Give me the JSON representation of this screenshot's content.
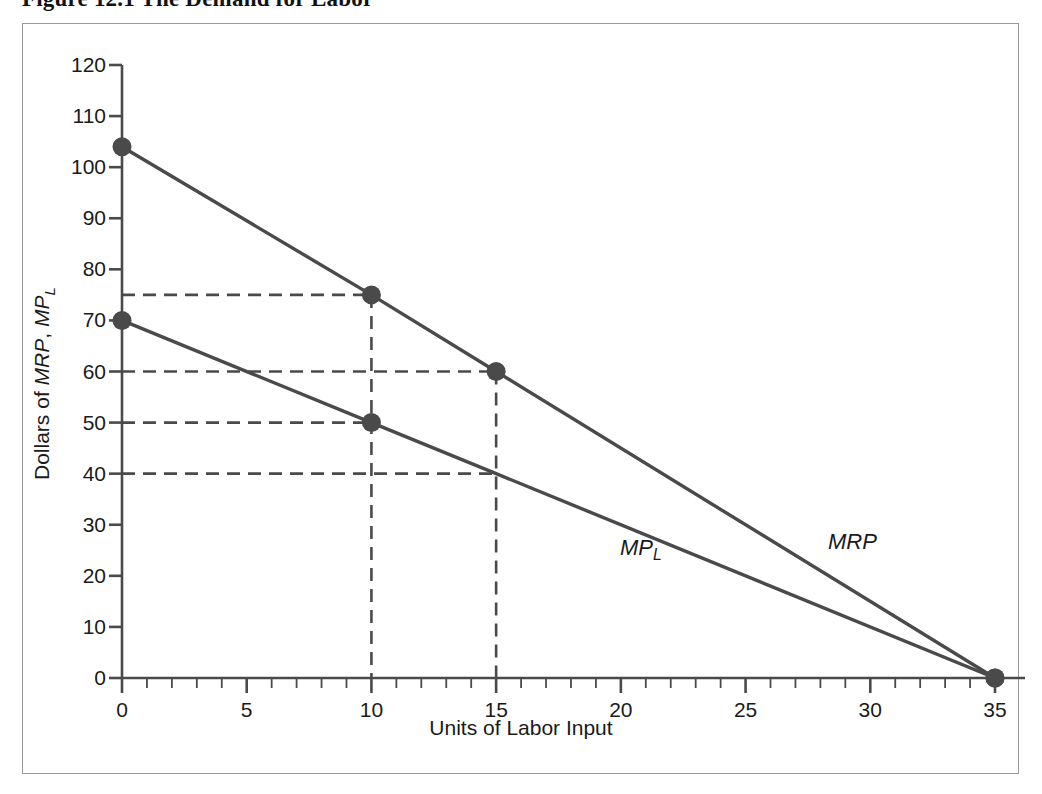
{
  "figure": {
    "caption": "Figure 12.1  The Demand for Labor",
    "border_color": "#9a9a9a",
    "background": "#ffffff"
  },
  "axes": {
    "x_title": "Units of Labor Input",
    "y_title_prefix": "Dollars of ",
    "y_title_series_1": "MRP",
    "y_title_separator": ", ",
    "y_title_series_2": "MP",
    "y_title_series_2_sub": "L",
    "x_ticks_major": [
      0,
      5,
      10,
      15,
      20,
      25,
      30,
      35
    ],
    "x_tick_labels": [
      "0",
      "5",
      "10",
      "15",
      "20",
      "25",
      "30",
      "35"
    ],
    "y_ticks_major": [
      0,
      10,
      20,
      30,
      40,
      50,
      60,
      70,
      80,
      90,
      100,
      110,
      120
    ],
    "y_tick_labels": [
      "0",
      "10",
      "20",
      "30",
      "40",
      "50",
      "60",
      "70",
      "80",
      "90",
      "100",
      "110",
      "120"
    ],
    "x_minor_interval": 1,
    "axis_color": "#4a4a4a"
  },
  "chart_data": {
    "type": "line",
    "title": "Figure 12.1  The Demand for Labor",
    "xlabel": "Units of Labor Input",
    "ylabel": "Dollars of MRP, MP_L",
    "xlim": [
      0,
      35
    ],
    "ylim": [
      0,
      120
    ],
    "grid": false,
    "legend": "inline-curve-labels",
    "series": [
      {
        "name": "MRP",
        "label": "MRP",
        "color": "#4a4a4a",
        "x": [
          0,
          10,
          15,
          35
        ],
        "y": [
          104,
          75,
          60,
          0
        ],
        "markers_at": [
          {
            "x": 0,
            "y": 104
          },
          {
            "x": 10,
            "y": 75
          },
          {
            "x": 15,
            "y": 60
          },
          {
            "x": 35,
            "y": 0
          }
        ]
      },
      {
        "name": "MP_L",
        "label": "MP",
        "label_sub": "L",
        "color": "#4a4a4a",
        "x": [
          0,
          10,
          15,
          35
        ],
        "y": [
          70,
          50,
          40,
          0
        ],
        "markers_at": [
          {
            "x": 0,
            "y": 70
          },
          {
            "x": 10,
            "y": 50
          },
          {
            "x": 35,
            "y": 0
          }
        ]
      }
    ],
    "guide_lines": {
      "color": "#4a4a4a",
      "style": "dashed",
      "horizontal_y": [
        75,
        60,
        50,
        40
      ],
      "vertical_x": [
        10,
        15
      ],
      "annotations": [
        {
          "x": 10,
          "y": 75,
          "series": "MRP"
        },
        {
          "x": 15,
          "y": 60,
          "series": "MRP"
        },
        {
          "x": 10,
          "y": 50,
          "series": "MP_L"
        },
        {
          "x": 15,
          "y": 40,
          "series": "MP_L"
        }
      ]
    }
  }
}
